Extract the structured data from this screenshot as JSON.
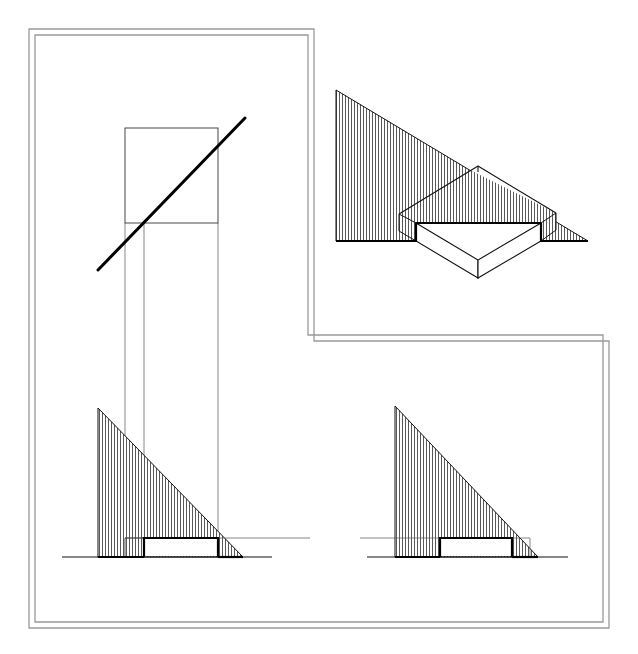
{
  "figure": {
    "frame": {
      "shape": "L-shaped double border",
      "color": "#9a9a9a"
    },
    "plan_view": {
      "square": {
        "x1": 125,
        "y1": 128,
        "x2": 218,
        "y2": 223
      },
      "light_ray": {
        "x1": 98,
        "y1": 270,
        "x2": 245,
        "y2": 118
      },
      "projection_lines_x": [
        125,
        144,
        218
      ]
    },
    "elevation_left": {
      "ground_y": 557,
      "shadow_triangle": [
        [
          98,
          408
        ],
        [
          98,
          557
        ],
        [
          243,
          557
        ]
      ],
      "block_top_y": 538,
      "block_x": [
        144,
        218
      ],
      "ghost_block_x": 125
    },
    "elevation_right": {
      "ground_y": 557,
      "shadow_triangle": [
        [
          395,
          406
        ],
        [
          395,
          557
        ],
        [
          538,
          557
        ]
      ],
      "block_top_y": 538,
      "block_x": [
        440,
        512
      ]
    },
    "isometric_view": {
      "shadow_triangle": [
        [
          336,
          90
        ],
        [
          336,
          241
        ],
        [
          588,
          241
        ]
      ],
      "block_top": [
        [
          399,
          214
        ],
        [
          478,
          166
        ],
        [
          556,
          213
        ]
      ],
      "block_front_bottom": [
        478,
        278
      ]
    },
    "hatch": {
      "direction": "vertical",
      "spacing": 3,
      "color": "#222222"
    }
  }
}
